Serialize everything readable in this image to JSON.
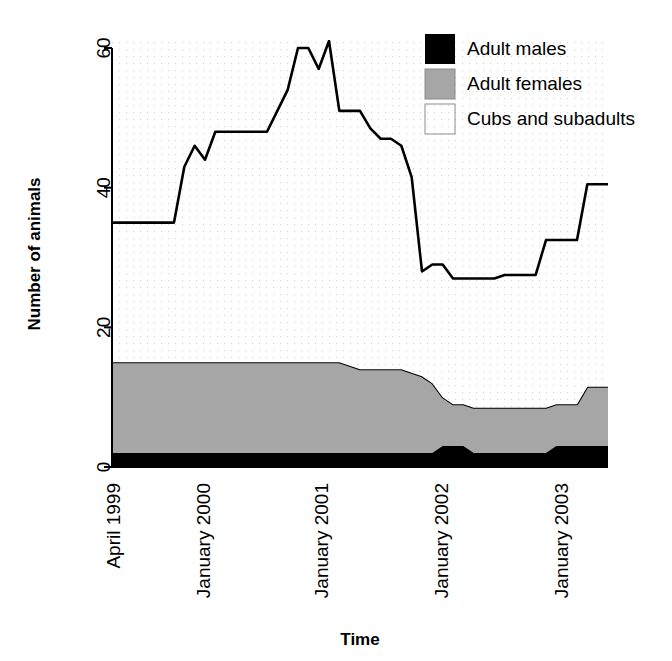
{
  "chart_data": {
    "type": "area",
    "title": "",
    "xlabel": "Time",
    "ylabel": "Number of animals",
    "stacked": true,
    "grid": false,
    "plot_background": "dotted-light-gray",
    "ylim": [
      0,
      62
    ],
    "yticks": [
      0,
      20,
      40,
      60
    ],
    "ytick_labels": [
      "0",
      "20",
      "40",
      "60"
    ],
    "xlim": [
      0,
      48
    ],
    "xticks": [
      2,
      11,
      23,
      35,
      47
    ],
    "xtick_labels": [
      "April 1999",
      "January 2000",
      "January 2001",
      "January 2002",
      "January 2003"
    ],
    "legend_position": "top-right",
    "series": [
      {
        "name": "Adult males",
        "color": "#000000",
        "values": [
          2,
          2,
          2,
          2,
          2,
          2,
          2,
          2,
          2,
          2,
          2,
          2,
          2,
          2,
          2,
          2,
          2,
          2,
          2,
          2,
          2,
          2,
          2,
          2,
          2,
          2,
          2,
          2,
          2,
          2,
          2,
          2,
          3,
          3,
          3,
          2,
          2,
          2,
          2,
          2,
          2,
          2,
          2,
          3,
          3,
          3,
          3,
          3,
          3
        ]
      },
      {
        "name": "Adult females",
        "color": "#a6a6a6",
        "values": [
          13,
          13,
          13,
          13,
          13,
          13,
          13,
          13,
          13,
          13,
          13,
          13,
          13,
          13,
          13,
          13,
          13,
          13,
          13,
          13,
          13,
          13,
          13,
          12.5,
          12,
          12,
          12,
          12,
          12,
          11.5,
          11,
          10,
          7,
          6,
          6,
          6.5,
          6.5,
          6.5,
          6.5,
          6.5,
          6.5,
          6.5,
          6.5,
          6,
          6,
          6,
          8.5,
          8.5,
          8.5
        ]
      },
      {
        "name": "Cubs and subadults",
        "color": "#ffffff",
        "values": [
          20,
          20,
          20,
          20,
          20,
          20,
          20,
          28,
          31,
          29,
          33,
          33,
          33,
          33,
          33,
          33,
          36,
          39,
          45,
          45,
          42,
          46,
          36,
          36.5,
          37,
          34.5,
          33,
          33,
          32,
          28,
          15,
          17,
          19,
          18,
          18,
          18.5,
          18.5,
          18.5,
          19,
          19,
          19,
          19,
          24,
          23.5,
          23.5,
          23.5,
          29,
          29,
          29
        ]
      }
    ],
    "totals": [
      35,
      35,
      35,
      35,
      35,
      35,
      35,
      43,
      46,
      44,
      48,
      48,
      48,
      48,
      48,
      48,
      51,
      54,
      60,
      60,
      57,
      61,
      51,
      51,
      51,
      48.5,
      47,
      47,
      46,
      41.5,
      28,
      29,
      29,
      27,
      27,
      27,
      27,
      27,
      27.5,
      27.5,
      27.5,
      27.5,
      32.5,
      32.5,
      32.5,
      32.5,
      40.5,
      40.5,
      40.5
    ]
  },
  "legend": {
    "items": [
      {
        "label": "Adult males",
        "swatch": "#000000"
      },
      {
        "label": "Adult females",
        "swatch": "#a6a6a6"
      },
      {
        "label": "Cubs and subadults",
        "swatch": "#ffffff"
      }
    ]
  }
}
